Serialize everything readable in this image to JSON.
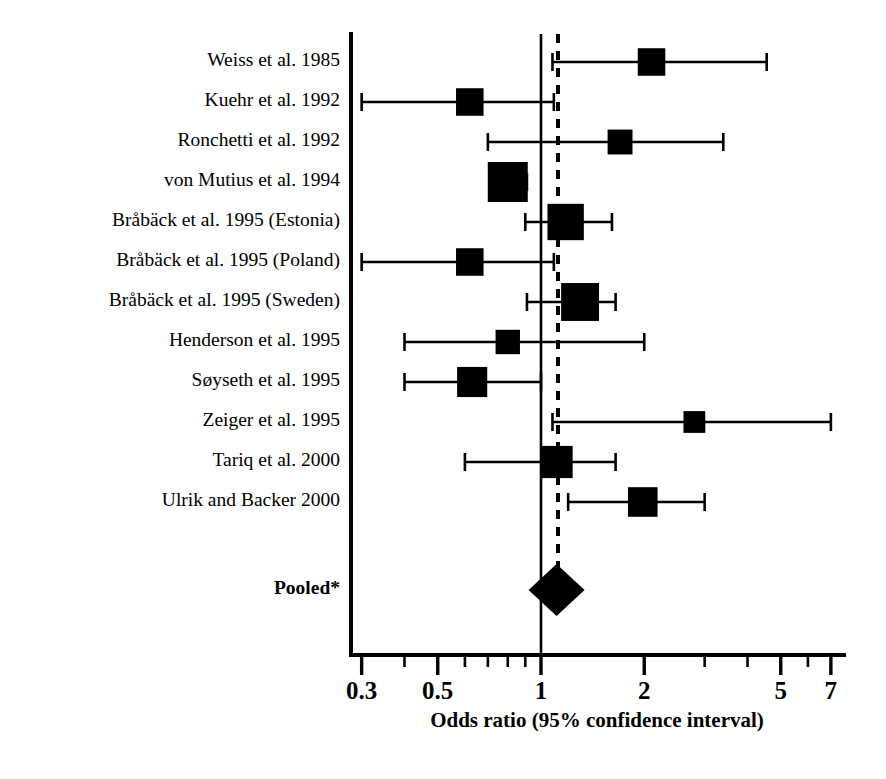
{
  "chart_data": {
    "type": "forest",
    "title": "",
    "xlabel": "Odds ratio (95% confidence interval)",
    "ylabel": "",
    "xscale": "log",
    "xlim": [
      0.3,
      7
    ],
    "grid": false,
    "null_value": 1,
    "pooled_reference_line": 1.11,
    "tick_labels": [
      "0.3",
      "0.5",
      "1",
      "2",
      "5",
      "7"
    ],
    "tick_values": [
      0.3,
      0.5,
      1,
      2,
      5,
      7
    ],
    "minor_tick_values": [
      0.4,
      0.6,
      0.7,
      0.8,
      0.9,
      3,
      4,
      6
    ],
    "categories": [
      "Weiss et al. 1985",
      "Kuehr et al. 1992",
      "Ronchetti et al. 1992",
      "von Mutius et al. 1994",
      "Bråbäck et al. 1995 (Estonia)",
      "Bråbäck et al. 1995 (Poland)",
      "Bråbäck et al. 1995 (Sweden)",
      "Henderson et al. 1995",
      "Søyseth et al. 1995",
      "Zeiger et al. 1995",
      "Tariq et al. 2000",
      "Ulrik and Backer 2000"
    ],
    "studies": [
      {
        "label": "Weiss et al. 1985",
        "or": 2.1,
        "ci_low": 1.08,
        "ci_high": 4.55,
        "weight": 0.52
      },
      {
        "label": "Kuehr et al. 1992",
        "or": 0.62,
        "ci_low": 0.3,
        "ci_high": 1.09,
        "weight": 0.52
      },
      {
        "label": "Ronchetti et al. 1992",
        "or": 1.7,
        "ci_low": 0.7,
        "ci_high": 3.4,
        "weight": 0.42
      },
      {
        "label": "von Mutius et al. 1994",
        "or": 0.8,
        "ci_low": 0.72,
        "ci_high": 0.91,
        "weight": 1.0
      },
      {
        "label": "Bråbäck et al. 1995 (Estonia)",
        "or": 1.18,
        "ci_low": 0.9,
        "ci_high": 1.61,
        "weight": 0.86
      },
      {
        "label": "Bråbäck et al. 1995 (Poland)",
        "or": 0.62,
        "ci_low": 0.3,
        "ci_high": 1.09,
        "weight": 0.52
      },
      {
        "label": "Bråbäck et al. 1995 (Sweden)",
        "or": 1.3,
        "ci_low": 0.91,
        "ci_high": 1.65,
        "weight": 0.92
      },
      {
        "label": "Henderson et al. 1995",
        "or": 0.8,
        "ci_low": 0.4,
        "ci_high": 2.0,
        "weight": 0.4
      },
      {
        "label": "Søyseth et al. 1995",
        "or": 0.63,
        "ci_low": 0.4,
        "ci_high": 1.0,
        "weight": 0.62
      },
      {
        "label": "Zeiger et al. 1995",
        "or": 2.8,
        "ci_low": 1.08,
        "ci_high": 7.0,
        "weight": 0.3
      },
      {
        "label": "Tariq et al. 2000",
        "or": 1.11,
        "ci_low": 0.6,
        "ci_high": 1.65,
        "weight": 0.7
      },
      {
        "label": "Ulrik and Backer 2000",
        "or": 1.98,
        "ci_low": 1.2,
        "ci_high": 3.0,
        "weight": 0.6
      }
    ],
    "pooled": {
      "label": "Pooled*",
      "or": 1.11,
      "ci_low": 0.92,
      "ci_high": 1.34
    }
  },
  "axis": {
    "title": "Odds ratio (95% confidence interval)",
    "ticks": [
      {
        "value": 0.3,
        "label": "0.3"
      },
      {
        "value": 0.5,
        "label": "0.5"
      },
      {
        "value": 1,
        "label": "1"
      },
      {
        "value": 2,
        "label": "2"
      },
      {
        "value": 5,
        "label": "5"
      },
      {
        "value": 7,
        "label": "7"
      }
    ]
  }
}
